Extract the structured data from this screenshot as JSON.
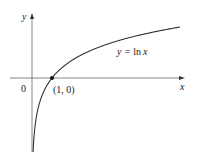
{
  "chart_data": {
    "type": "line",
    "title": "",
    "function": "y = ln x",
    "series": [
      {
        "name": "y = ln x",
        "x": [
          0.055,
          0.1,
          0.2,
          0.4,
          0.6,
          1,
          1.5,
          2,
          3,
          4,
          5,
          6,
          7.4
        ],
        "values": [
          -2.9,
          -2.303,
          -1.609,
          -0.916,
          -0.511,
          0,
          0.405,
          0.693,
          1.099,
          1.386,
          1.609,
          1.792,
          2.0
        ]
      }
    ],
    "annotations": [
      {
        "text": "(1, 0)",
        "x": 1,
        "y": 0
      },
      {
        "text": "0",
        "x": 0,
        "y": 0
      }
    ],
    "xlabel": "x",
    "ylabel": "y",
    "xlim": [
      -1.1,
      7.6
    ],
    "ylim": [
      -3.3,
      2.5
    ],
    "grid": false,
    "legend": "none"
  },
  "labels": {
    "y_axis": "y",
    "x_axis": "x",
    "origin": "0",
    "point": "(1, 0)",
    "curve_prefix": "y = ",
    "curve_fn": "ln",
    "curve_var": "x"
  },
  "colors": {
    "axis": "#555555",
    "curve": "#333333",
    "point": "#111111"
  }
}
